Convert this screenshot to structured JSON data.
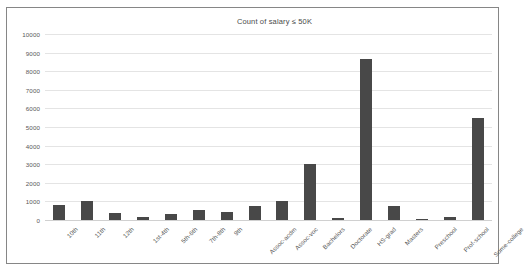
{
  "chart_data": {
    "type": "bar",
    "title": "Count of salary ≤ 50K",
    "xlabel": "",
    "ylabel": "",
    "ylim": [
      0,
      10000
    ],
    "ytick_step": 1000,
    "yticks": [
      "10000",
      "9000",
      "8000",
      "7000",
      "6000",
      "5000",
      "4000",
      "3000",
      "2000",
      "1000",
      "0"
    ],
    "grid": true,
    "legend": false,
    "bar_color": "#484848",
    "categories": [
      "10th",
      "11th",
      "12th",
      "1st-4th",
      "5th-6th",
      "7th-8th",
      "9th",
      "Assoc-acdm",
      "Assoc-voc",
      "Bachelors",
      "Doctorate",
      "HS-grad",
      "Masters",
      "Preschool",
      "Prof-school",
      "Some-college"
    ],
    "values": [
      820,
      1000,
      380,
      160,
      320,
      520,
      420,
      760,
      1020,
      3000,
      110,
      8650,
      760,
      50,
      150,
      5500
    ]
  }
}
